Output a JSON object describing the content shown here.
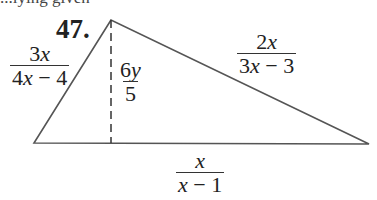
{
  "header": {
    "partial_text": "...lying given"
  },
  "problem": {
    "number": "47."
  },
  "diagram": {
    "shape": "triangle",
    "vertices": {
      "apex": [
        111,
        20
      ],
      "bottom_left": [
        34,
        143
      ],
      "bottom_right": [
        369,
        144
      ]
    },
    "altitude": {
      "style": "dashed",
      "from": [
        111,
        20
      ],
      "to": [
        111,
        143
      ],
      "label": {
        "numerator": "6y",
        "denominator": "5"
      }
    },
    "sides": {
      "left": {
        "numerator": "3x",
        "denominator": "4x − 4"
      },
      "right": {
        "numerator": "2x",
        "denominator": "3x − 3"
      },
      "base": {
        "numerator": "x",
        "denominator": "x − 1"
      }
    },
    "colors": {
      "line": "#555555",
      "text": "#222222"
    }
  }
}
